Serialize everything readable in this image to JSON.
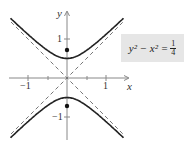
{
  "chart_data": {
    "type": "line",
    "title": "",
    "equation": {
      "lhs": "y² − x² =",
      "num": "1",
      "den": "4"
    },
    "xlabel": "x",
    "ylabel": "y",
    "xlim": [
      -1.5,
      1.5
    ],
    "ylim": [
      -1.5,
      1.5
    ],
    "x_ticks": [
      -1,
      -0.5,
      0.5,
      1
    ],
    "x_tick_labels": [
      "−1",
      "1"
    ],
    "y_ticks": [
      -1,
      -0.5,
      0.5,
      1
    ],
    "y_tick_labels": [
      "1",
      "−1"
    ],
    "series": [
      {
        "name": "upper branch",
        "style": "solid",
        "function": "y = sqrt(x^2 + 1/4)"
      },
      {
        "name": "lower branch",
        "style": "solid",
        "function": "y = -sqrt(x^2 + 1/4)"
      },
      {
        "name": "asymptote y=x",
        "style": "dashed"
      },
      {
        "name": "asymptote y=-x",
        "style": "dashed"
      }
    ],
    "points": [
      {
        "name": "focus",
        "x": 0,
        "y": 0.707
      },
      {
        "name": "focus",
        "x": 0,
        "y": -0.707
      }
    ],
    "grid": false
  }
}
